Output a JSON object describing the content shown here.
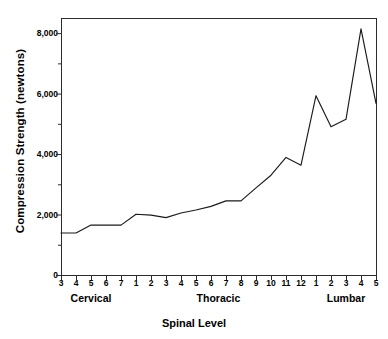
{
  "chart_data": {
    "type": "line",
    "title": "",
    "xlabel": "Spinal Level",
    "ylabel": "Compression Strength (newtons)",
    "ylim": [
      0,
      8500
    ],
    "yticks": [
      0,
      2000,
      4000,
      6000,
      8000
    ],
    "ytick_labels": [
      "0",
      "2,000",
      "4,000",
      "6,000",
      "8,000"
    ],
    "y_minor_ticks": [
      1000,
      3000,
      5000,
      7000
    ],
    "grid": false,
    "legend": null,
    "categories": [
      "3",
      "4",
      "5",
      "6",
      "7",
      "1",
      "2",
      "3",
      "4",
      "5",
      "6",
      "7",
      "8",
      "9",
      "10",
      "11",
      "12",
      "1",
      "2",
      "3",
      "4",
      "5"
    ],
    "groups": [
      {
        "label": "Cervical",
        "levels": [
          "3",
          "4",
          "5",
          "6",
          "7"
        ]
      },
      {
        "label": "Thoracic",
        "levels": [
          "1",
          "2",
          "3",
          "4",
          "5",
          "6",
          "7",
          "8",
          "9",
          "10",
          "11",
          "12"
        ]
      },
      {
        "label": "Lumbar",
        "levels": [
          "1",
          "2",
          "3",
          "4",
          "5"
        ]
      }
    ],
    "values": [
      1390,
      1390,
      1650,
      1650,
      1650,
      2010,
      1980,
      1900,
      2050,
      2150,
      2270,
      2450,
      2450,
      2880,
      3300,
      3890,
      3630,
      5930,
      4900,
      5150,
      8140,
      5680
    ],
    "series": [
      {
        "name": "Compression Strength",
        "color": "#1a1a1a",
        "points": [
          {
            "group": "Cervical",
            "level": "C3",
            "tick": "3",
            "value": 1390
          },
          {
            "group": "Cervical",
            "level": "C4",
            "tick": "4",
            "value": 1390
          },
          {
            "group": "Cervical",
            "level": "C5",
            "tick": "5",
            "value": 1650
          },
          {
            "group": "Cervical",
            "level": "C6",
            "tick": "6",
            "value": 1650
          },
          {
            "group": "Cervical",
            "level": "C7",
            "tick": "7",
            "value": 1650
          },
          {
            "group": "Thoracic",
            "level": "T1",
            "tick": "1",
            "value": 2010
          },
          {
            "group": "Thoracic",
            "level": "T2",
            "tick": "2",
            "value": 1980
          },
          {
            "group": "Thoracic",
            "level": "T3",
            "tick": "3",
            "value": 1900
          },
          {
            "group": "Thoracic",
            "level": "T4",
            "tick": "4",
            "value": 2050
          },
          {
            "group": "Thoracic",
            "level": "T5",
            "tick": "5",
            "value": 2150
          },
          {
            "group": "Thoracic",
            "level": "T6",
            "tick": "6",
            "value": 2270
          },
          {
            "group": "Thoracic",
            "level": "T7",
            "tick": "7",
            "value": 2450
          },
          {
            "group": "Thoracic",
            "level": "T8",
            "tick": "8",
            "value": 2450
          },
          {
            "group": "Thoracic",
            "level": "T9",
            "tick": "9",
            "value": 2880
          },
          {
            "group": "Thoracic",
            "level": "T10",
            "tick": "10",
            "value": 3300
          },
          {
            "group": "Thoracic",
            "level": "T11",
            "tick": "11",
            "value": 3890
          },
          {
            "group": "Thoracic",
            "level": "T12",
            "tick": "12",
            "value": 3630
          },
          {
            "group": "Lumbar",
            "level": "L1",
            "tick": "1",
            "value": 5930
          },
          {
            "group": "Lumbar",
            "level": "L2",
            "tick": "2",
            "value": 4900
          },
          {
            "group": "Lumbar",
            "level": "L3",
            "tick": "3",
            "value": 5150
          },
          {
            "group": "Lumbar",
            "level": "L4",
            "tick": "4",
            "value": 8140
          },
          {
            "group": "Lumbar",
            "level": "L5",
            "tick": "5",
            "value": 5680
          }
        ]
      }
    ],
    "axis_color": "#2b2b2b",
    "line_color": "#1a1a1a"
  }
}
